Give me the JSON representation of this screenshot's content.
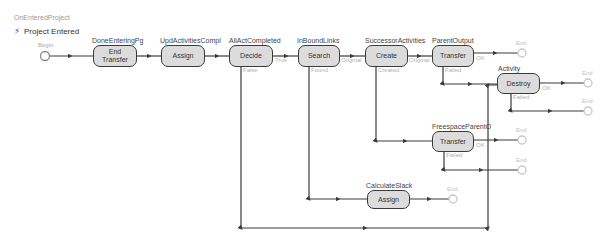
{
  "header": {
    "workflow_name": "OnEnteredProject",
    "trigger_label": "Project Entered",
    "trigger_icon": "lightning-bolt-icon"
  },
  "start": {
    "label": "Begin"
  },
  "nodes": [
    {
      "id": "n1",
      "name": "DoneEnteringPg",
      "action": "End Transfer",
      "action_line1": "End",
      "action_line2": "Transfer"
    },
    {
      "id": "n2",
      "name": "UpdActivitiesCompl",
      "action": "Assign"
    },
    {
      "id": "n3",
      "name": "AllActCompleted",
      "action": "Decide",
      "ports": [
        "True",
        "False"
      ]
    },
    {
      "id": "n4",
      "name": "InBoundLinks",
      "action": "Search",
      "ports": [
        "Original",
        "Found"
      ]
    },
    {
      "id": "n5",
      "name": "SuccessorActivities",
      "action": "Create",
      "ports": [
        "Original",
        "Created"
      ]
    },
    {
      "id": "n6",
      "name": "ParentOutput",
      "action": "Transfer",
      "ports": [
        "OK",
        "Failed"
      ]
    },
    {
      "id": "n7",
      "name": "Activity",
      "action": "Destroy",
      "ports": [
        "OK",
        "Failed"
      ]
    },
    {
      "id": "n8",
      "name": "FreespaceParentO",
      "action": "Transfer",
      "ports": [
        "OK",
        "Failed"
      ]
    },
    {
      "id": "n9",
      "name": "CalculateSlack",
      "action": "Assign"
    }
  ],
  "terminal_label": "End",
  "colors": {
    "node_fill": "#dcdcdc",
    "node_border": "#3a3a3a",
    "connector": "#3a3a3a",
    "muted_text": "#b0b0b0",
    "terminal": "#c8c8c8"
  }
}
